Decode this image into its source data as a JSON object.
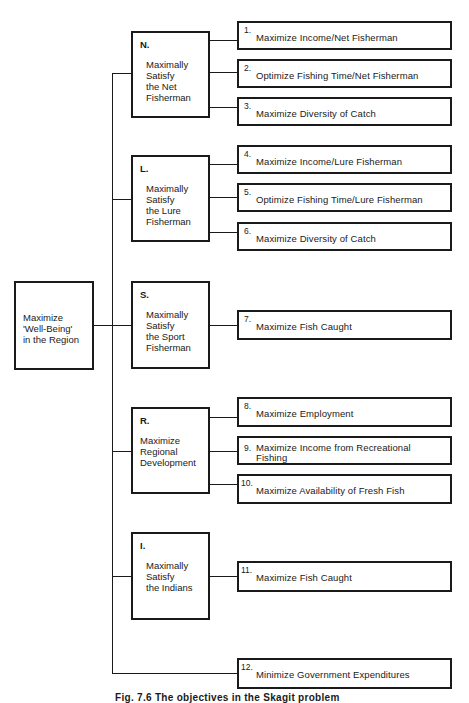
{
  "diagram": {
    "type": "objectives-hierarchy",
    "root": {
      "label": "Maximize\n'Well-Being'\nin the Region"
    },
    "branches": [
      {
        "letter": "N.",
        "label": "Maximally\nSatisfy\nthe Net\nFisherman",
        "objectives": [
          {
            "num": "1.",
            "label": "Maximize Income/Net Fisherman"
          },
          {
            "num": "2.",
            "label": "Optimize Fishing Time/Net Fisherman"
          },
          {
            "num": "3.",
            "label": "Maximize Diversity of Catch"
          }
        ]
      },
      {
        "letter": "L.",
        "label": "Maximally\nSatisfy\nthe Lure\nFisherman",
        "objectives": [
          {
            "num": "4.",
            "label": "Maximize Income/Lure Fisherman"
          },
          {
            "num": "5.",
            "label": "Optimize Fishing Time/Lure Fisherman"
          },
          {
            "num": "6.",
            "label": "Maximize Diversity of Catch"
          }
        ]
      },
      {
        "letter": "S.",
        "label": "Maximally\nSatisfy\nthe Sport\nFisherman",
        "objectives": [
          {
            "num": "7.",
            "label": "Maximize Fish Caught"
          }
        ]
      },
      {
        "letter": "R.",
        "label": "Maximize\nRegional\nDevelopment",
        "objectives": [
          {
            "num": "8.",
            "label": "Maximize Employment"
          },
          {
            "num": "9.",
            "label": "Maximize Income from Recreational\nFishing"
          },
          {
            "num": "10.",
            "label": "Maximize Availability of Fresh Fish"
          }
        ]
      },
      {
        "letter": "I.",
        "label": "Maximally\nSatisfy\nthe Indians",
        "objectives": [
          {
            "num": "11.",
            "label": "Maximize Fish Caught"
          }
        ]
      }
    ],
    "direct_objectives": [
      {
        "num": "12.",
        "label": "Minimize Government Expenditures"
      }
    ],
    "caption": "Fig. 7.6   The objectives in the Skagit problem"
  }
}
